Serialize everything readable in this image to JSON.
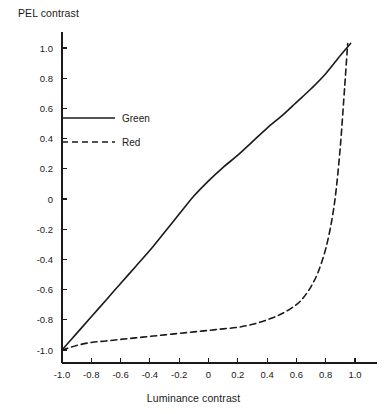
{
  "chart_data": {
    "type": "line",
    "title": "",
    "xlabel": "Luminance contrast",
    "ylabel": "PEL contrast",
    "xlim": [
      -1.12,
      1.12
    ],
    "ylim": [
      -1.12,
      1.12
    ],
    "grid": false,
    "legend_position": "upper-left-inside",
    "xticks": [
      "-1.0",
      "-0.8",
      "-0.6",
      "-0.4",
      "-0.2",
      "0",
      "0.2",
      "0.4",
      "0.6",
      "0.8",
      "1.0"
    ],
    "xtick_values": [
      -1.0,
      -0.8,
      -0.6,
      -0.4,
      -0.2,
      0,
      0.2,
      0.4,
      0.6,
      0.8,
      1.0
    ],
    "yticks": [
      "1.0",
      "0.8",
      "0.6",
      "0.4",
      "0.2",
      "0",
      "-0.2",
      "-0.4",
      "-0.6",
      "-0.8",
      "-1.0"
    ],
    "ytick_values": [
      1.0,
      0.8,
      0.6,
      0.4,
      0.2,
      0,
      -0.2,
      -0.4,
      -0.6,
      -0.8,
      -1.0
    ],
    "series": [
      {
        "name": "Green",
        "style": "solid",
        "color": "#1a1a1a",
        "x": [
          -1.0,
          -0.9,
          -0.8,
          -0.7,
          -0.6,
          -0.5,
          -0.4,
          -0.3,
          -0.2,
          -0.1,
          0.0,
          0.1,
          0.2,
          0.3,
          0.4,
          0.5,
          0.6,
          0.7,
          0.8,
          0.9,
          0.97
        ],
        "y": [
          -1.0,
          -0.89,
          -0.78,
          -0.67,
          -0.56,
          -0.45,
          -0.34,
          -0.22,
          -0.1,
          0.02,
          0.12,
          0.21,
          0.29,
          0.38,
          0.47,
          0.55,
          0.64,
          0.73,
          0.83,
          0.95,
          1.03
        ]
      },
      {
        "name": "Red",
        "style": "dashed",
        "color": "#1a1a1a",
        "x": [
          -1.0,
          -0.9,
          -0.8,
          -0.7,
          -0.6,
          -0.5,
          -0.4,
          -0.3,
          -0.2,
          -0.1,
          0.0,
          0.1,
          0.2,
          0.3,
          0.4,
          0.5,
          0.6,
          0.65,
          0.7,
          0.75,
          0.8,
          0.84,
          0.87,
          0.9,
          0.93,
          0.95
        ],
        "y": [
          -1.0,
          -0.97,
          -0.95,
          -0.94,
          -0.93,
          -0.92,
          -0.91,
          -0.9,
          -0.89,
          -0.88,
          -0.87,
          -0.86,
          -0.85,
          -0.83,
          -0.8,
          -0.76,
          -0.7,
          -0.65,
          -0.58,
          -0.48,
          -0.33,
          -0.15,
          0.05,
          0.35,
          0.75,
          1.03
        ]
      }
    ]
  },
  "legend": {
    "entries": [
      {
        "label": "Green",
        "style": "solid"
      },
      {
        "label": "Red",
        "style": "dashed"
      }
    ]
  }
}
